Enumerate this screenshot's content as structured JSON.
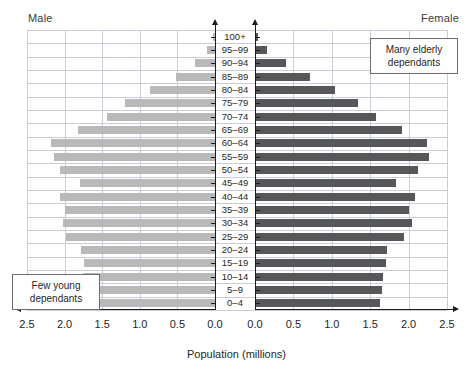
{
  "header": {
    "male_label": "Male",
    "female_label": "Female"
  },
  "axis": {
    "x_title": "Population (millions)",
    "male_ticks": [
      "2.5",
      "2.0",
      "1.5",
      "1.0",
      "0.5",
      "0.0"
    ],
    "female_ticks": [
      "0.0",
      "0.5",
      "1.0",
      "1.5",
      "2.0",
      "2.5"
    ]
  },
  "annotations": [
    {
      "id": "elderly",
      "line1": "Many elderly",
      "line2": "dependants"
    },
    {
      "id": "young",
      "line1": "Few young",
      "line2": "dependants"
    }
  ],
  "chart_data": {
    "type": "bar",
    "title": "",
    "subtitle": "",
    "xlabel": "Population (millions)",
    "ylabel": "",
    "xlim": [
      0,
      2.5
    ],
    "grid": true,
    "legend_position": "top-corners",
    "categories": [
      "0–4",
      "5–9",
      "10–14",
      "15–19",
      "20–24",
      "25–29",
      "30–34",
      "35–39",
      "40–44",
      "45–49",
      "50–54",
      "55–59",
      "60–64",
      "65–69",
      "70–74",
      "75–79",
      "80–84",
      "85–89",
      "90–94",
      "95–99",
      "100+"
    ],
    "series": [
      {
        "name": "Male",
        "side": "left",
        "color": "#b9b9b9",
        "values": [
          1.72,
          1.78,
          1.76,
          1.74,
          1.78,
          1.98,
          2.02,
          2.0,
          2.06,
          1.8,
          2.06,
          2.14,
          2.18,
          1.82,
          1.44,
          1.2,
          0.86,
          0.52,
          0.27,
          0.1,
          0.03
        ]
      },
      {
        "name": "Female",
        "side": "right",
        "color": "#555759",
        "values": [
          1.63,
          1.66,
          1.67,
          1.7,
          1.72,
          1.94,
          2.04,
          2.0,
          2.08,
          1.83,
          2.12,
          2.26,
          2.24,
          1.92,
          1.58,
          1.34,
          1.04,
          0.72,
          0.4,
          0.16,
          0.04
        ]
      }
    ]
  }
}
